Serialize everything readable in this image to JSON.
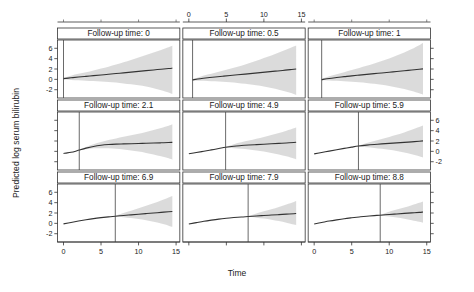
{
  "figure": {
    "title": "",
    "y_axis_label": "Predicted log serum bilirubin",
    "x_axis_label": "Time"
  },
  "chart_data": {
    "type": "line",
    "title": "",
    "subtitle": "",
    "xlabel": "Time",
    "ylabel": "Predicted log serum bilirubin",
    "xlim": [
      -0.8,
      15.5
    ],
    "ylim": [
      -3.6,
      7.6
    ],
    "xticks": [
      0,
      5,
      10,
      15
    ],
    "yticks": [
      -2,
      0,
      2,
      4,
      6
    ],
    "xticklabels": [
      "0",
      "5",
      "10",
      "15"
    ],
    "yticklabels": [
      "-2",
      "0",
      "2",
      "4",
      "6"
    ],
    "grid": false,
    "legend": "none",
    "layout": {
      "rows": 3,
      "cols": 3
    },
    "strip_prefix": "Follow-up time:",
    "axis_placement": {
      "top_axis_columns": [
        2
      ],
      "bottom_axis_columns": [
        1,
        3
      ],
      "left_axis_rows": [
        1,
        3
      ],
      "right_axis_rows": [
        2
      ]
    },
    "band_fill": "#d9d9d9",
    "line_color": "#333333",
    "vline_color": "#444444",
    "panels": [
      {
        "label": "Follow-up time: 0",
        "followup_time": 0,
        "row": 1,
        "col": 1,
        "x": [
          0,
          1,
          2,
          3,
          4,
          5,
          6,
          7,
          8,
          9,
          10,
          11,
          12,
          13,
          14,
          14.5
        ],
        "fit": [
          0.15,
          0.3,
          0.45,
          0.58,
          0.72,
          0.85,
          0.98,
          1.12,
          1.26,
          1.4,
          1.54,
          1.68,
          1.82,
          1.96,
          2.1,
          2.16
        ],
        "lower": [
          0.0,
          -0.1,
          -0.18,
          -0.25,
          -0.32,
          -0.4,
          -0.5,
          -0.62,
          -0.78,
          -0.95,
          -1.15,
          -1.4,
          -1.7,
          -2.1,
          -2.55,
          -2.85
        ],
        "upper": [
          0.3,
          0.72,
          1.06,
          1.38,
          1.72,
          2.08,
          2.45,
          2.86,
          3.3,
          3.76,
          4.22,
          4.7,
          5.18,
          5.68,
          6.2,
          6.5
        ]
      },
      {
        "label": "Follow-up time: 0.5",
        "followup_time": 0.5,
        "row": 1,
        "col": 2,
        "x": [
          0.5,
          1.5,
          2.5,
          3.5,
          4.5,
          5.5,
          6.5,
          7.5,
          8.5,
          9.5,
          10.5,
          11.5,
          12.5,
          13.5,
          14.3
        ],
        "fit": [
          -0.1,
          0.12,
          0.3,
          0.45,
          0.6,
          0.74,
          0.88,
          1.02,
          1.16,
          1.3,
          1.44,
          1.58,
          1.72,
          1.88,
          2.0
        ],
        "lower": [
          -0.22,
          -0.28,
          -0.32,
          -0.38,
          -0.46,
          -0.56,
          -0.68,
          -0.84,
          -1.02,
          -1.24,
          -1.5,
          -1.82,
          -2.18,
          -2.6,
          -3.0
        ],
        "upper": [
          0.02,
          0.52,
          0.92,
          1.28,
          1.66,
          2.04,
          2.44,
          2.88,
          3.34,
          3.84,
          4.36,
          4.9,
          5.46,
          6.06,
          6.55
        ]
      },
      {
        "label": "Follow-up time: 1",
        "followup_time": 1,
        "row": 1,
        "col": 3,
        "x": [
          1,
          2,
          3,
          4,
          5,
          6,
          7,
          8,
          9,
          10,
          11,
          12,
          13,
          14,
          14.5
        ],
        "fit": [
          -0.05,
          0.18,
          0.36,
          0.52,
          0.68,
          0.82,
          0.96,
          1.1,
          1.24,
          1.38,
          1.52,
          1.66,
          1.8,
          1.95,
          2.02
        ],
        "lower": [
          -0.18,
          -0.22,
          -0.28,
          -0.35,
          -0.45,
          -0.56,
          -0.7,
          -0.86,
          -1.06,
          -1.28,
          -1.55,
          -1.88,
          -2.25,
          -2.7,
          -2.95
        ],
        "upper": [
          0.08,
          0.58,
          1.0,
          1.39,
          1.81,
          2.2,
          2.62,
          3.06,
          3.54,
          4.04,
          4.59,
          5.2,
          5.85,
          6.6,
          7.0
        ]
      },
      {
        "label": "Follow-up time: 2.1",
        "followup_time": 2.1,
        "row": 2,
        "col": 1,
        "x": [
          0,
          0.5,
          1,
          1.5,
          2.1,
          3,
          4,
          5,
          6,
          7,
          8,
          9,
          10,
          11,
          12,
          13,
          14,
          14.5
        ],
        "fit": [
          -0.4,
          -0.3,
          -0.18,
          -0.02,
          0.25,
          0.62,
          0.95,
          1.18,
          1.32,
          1.4,
          1.44,
          1.48,
          1.52,
          1.56,
          1.6,
          1.65,
          1.7,
          1.74
        ],
        "lower": [
          null,
          null,
          null,
          null,
          0.18,
          0.4,
          0.58,
          0.62,
          0.58,
          0.48,
          0.34,
          0.16,
          -0.05,
          -0.3,
          -0.6,
          -0.95,
          -1.35,
          -1.6
        ],
        "upper": [
          null,
          null,
          null,
          null,
          0.32,
          0.86,
          1.38,
          1.82,
          2.18,
          2.5,
          2.8,
          3.1,
          3.42,
          3.76,
          4.12,
          4.52,
          4.95,
          5.25
        ]
      },
      {
        "label": "Follow-up time: 4.9",
        "followup_time": 4.9,
        "row": 2,
        "col": 2,
        "x": [
          0,
          1,
          2,
          3,
          4,
          4.9,
          6,
          7,
          8,
          9,
          10,
          11,
          12,
          13,
          14,
          14.3
        ],
        "fit": [
          -0.45,
          -0.22,
          0.02,
          0.28,
          0.55,
          0.8,
          1.0,
          1.12,
          1.22,
          1.3,
          1.38,
          1.46,
          1.54,
          1.62,
          1.72,
          1.76
        ],
        "lower": [
          null,
          null,
          null,
          null,
          null,
          0.74,
          0.62,
          0.5,
          0.36,
          0.18,
          -0.04,
          -0.3,
          -0.6,
          -0.96,
          -1.38,
          -1.52
        ],
        "upper": [
          null,
          null,
          null,
          null,
          null,
          0.86,
          1.38,
          1.74,
          2.08,
          2.42,
          2.78,
          3.16,
          3.56,
          4.0,
          4.48,
          4.62
        ]
      },
      {
        "label": "Follow-up time: 5.9",
        "followup_time": 5.9,
        "row": 2,
        "col": 3,
        "x": [
          0,
          1,
          2,
          3,
          4,
          5,
          5.9,
          7,
          8,
          9,
          10,
          11,
          12,
          13,
          14,
          14.5
        ],
        "fit": [
          -0.48,
          -0.22,
          0.05,
          0.32,
          0.58,
          0.82,
          1.02,
          1.2,
          1.33,
          1.44,
          1.54,
          1.64,
          1.74,
          1.84,
          1.96,
          2.02
        ],
        "lower": [
          null,
          null,
          null,
          null,
          null,
          null,
          0.96,
          0.8,
          0.66,
          0.5,
          0.3,
          0.06,
          -0.22,
          -0.56,
          -0.95,
          -1.18
        ],
        "upper": [
          null,
          null,
          null,
          null,
          null,
          null,
          1.08,
          1.6,
          2.0,
          2.38,
          2.78,
          3.2,
          3.66,
          4.16,
          4.7,
          5.0
        ]
      },
      {
        "label": "Follow-up time: 6.9",
        "followup_time": 6.9,
        "row": 3,
        "col": 1,
        "x": [
          0,
          1,
          2,
          3,
          4,
          5,
          6,
          6.9,
          8,
          9,
          10,
          11,
          12,
          13,
          14,
          14.5
        ],
        "fit": [
          -0.1,
          0.18,
          0.45,
          0.7,
          0.92,
          1.1,
          1.26,
          1.38,
          1.52,
          1.64,
          1.76,
          1.88,
          2.0,
          2.12,
          2.24,
          2.3
        ],
        "lower": [
          null,
          null,
          null,
          null,
          null,
          null,
          null,
          1.32,
          1.18,
          1.02,
          0.82,
          0.58,
          0.3,
          -0.04,
          -0.44,
          -0.66
        ],
        "upper": [
          null,
          null,
          null,
          null,
          null,
          null,
          null,
          1.44,
          2.0,
          2.44,
          2.9,
          3.38,
          3.88,
          4.42,
          5.0,
          5.3
        ]
      },
      {
        "label": "Follow-up time: 7.9",
        "followup_time": 7.9,
        "row": 3,
        "col": 2,
        "x": [
          0,
          1,
          2,
          3,
          4,
          5,
          6,
          7,
          7.9,
          9,
          10,
          11,
          12,
          13,
          14,
          14.3
        ],
        "fit": [
          -0.12,
          0.14,
          0.4,
          0.62,
          0.82,
          0.98,
          1.12,
          1.24,
          1.32,
          1.42,
          1.52,
          1.6,
          1.68,
          1.78,
          1.86,
          1.9
        ],
        "lower": [
          null,
          null,
          null,
          null,
          null,
          null,
          null,
          null,
          1.26,
          1.1,
          0.92,
          0.7,
          0.44,
          0.14,
          -0.22,
          -0.35
        ],
        "upper": [
          null,
          null,
          null,
          null,
          null,
          null,
          null,
          null,
          1.38,
          1.9,
          2.32,
          2.74,
          3.18,
          3.66,
          4.14,
          4.32
        ]
      },
      {
        "label": "Follow-up time: 8.8",
        "followup_time": 8.8,
        "row": 3,
        "col": 3,
        "x": [
          0,
          1,
          2,
          3,
          4,
          5,
          6,
          7,
          8,
          8.8,
          10,
          11,
          12,
          13,
          14,
          14.5
        ],
        "fit": [
          -0.12,
          0.16,
          0.44,
          0.68,
          0.9,
          1.08,
          1.24,
          1.38,
          1.5,
          1.58,
          1.72,
          1.82,
          1.92,
          2.02,
          2.12,
          2.18
        ],
        "lower": [
          null,
          null,
          null,
          null,
          null,
          null,
          null,
          null,
          null,
          1.52,
          1.34,
          1.14,
          0.9,
          0.62,
          0.3,
          0.12
        ],
        "upper": [
          null,
          null,
          null,
          null,
          null,
          null,
          null,
          null,
          null,
          1.64,
          2.26,
          2.66,
          3.08,
          3.52,
          3.98,
          4.24
        ]
      }
    ]
  }
}
